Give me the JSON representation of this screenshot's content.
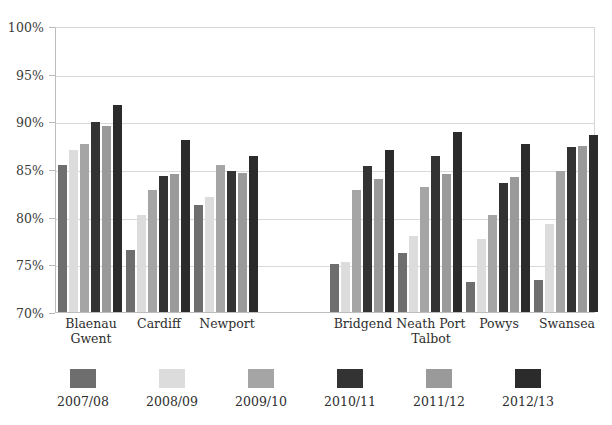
{
  "chart_data": {
    "type": "bar",
    "title": "",
    "subtitle": "",
    "xlabel": "",
    "ylabel": "",
    "ylim": [
      70,
      100
    ],
    "ytick_labels": [
      "100%",
      "95%",
      "90%",
      "85%",
      "80%",
      "75%",
      "70%"
    ],
    "ytick_values": [
      100,
      95,
      90,
      85,
      80,
      75,
      70
    ],
    "grid": true,
    "legend_position": "bottom",
    "categories": [
      "Blaenau\nGwent",
      "Cardiff",
      "Newport",
      "",
      "Bridgend",
      "Neath Port\nTalbot",
      "Powys",
      "Swansea"
    ],
    "series": [
      {
        "name": "2007/08",
        "color": "#6e6e6e",
        "values": [
          85.4,
          76.5,
          81.2,
          null,
          75.0,
          76.2,
          73.1,
          73.4
        ]
      },
      {
        "name": "2008/09",
        "color": "#dcdcdc",
        "values": [
          87.0,
          80.2,
          82.1,
          null,
          75.2,
          78.0,
          77.7,
          79.2
        ]
      },
      {
        "name": "2009/10",
        "color": "#a5a5a5",
        "values": [
          87.6,
          82.8,
          85.4,
          null,
          82.8,
          83.1,
          80.2,
          84.8
        ]
      },
      {
        "name": "2010/11",
        "color": "#333333",
        "values": [
          89.9,
          84.3,
          84.8,
          null,
          85.3,
          86.4,
          83.5,
          87.3
        ]
      },
      {
        "name": "2011/12",
        "color": "#9a9a9a",
        "values": [
          89.5,
          84.5,
          84.6,
          null,
          84.0,
          84.5,
          84.2,
          87.4
        ]
      },
      {
        "name": "2012/13",
        "color": "#2b2b2b",
        "values": [
          91.7,
          88.0,
          86.4,
          null,
          87.0,
          88.9,
          87.6,
          88.6
        ]
      }
    ]
  },
  "legend": {
    "items": [
      {
        "label": "2007/08",
        "color": "#6e6e6e"
      },
      {
        "label": "2008/09",
        "color": "#dcdcdc"
      },
      {
        "label": "2009/10",
        "color": "#a5a5a5"
      },
      {
        "label": "2010/11",
        "color": "#333333"
      },
      {
        "label": "2011/12",
        "color": "#9a9a9a"
      },
      {
        "label": "2012/13",
        "color": "#2b2b2b"
      }
    ]
  },
  "colors": {
    "gridline": "#d9d9d9",
    "axis": "#bdbdbd",
    "text": "#2e2e2e",
    "background": "#ffffff"
  }
}
